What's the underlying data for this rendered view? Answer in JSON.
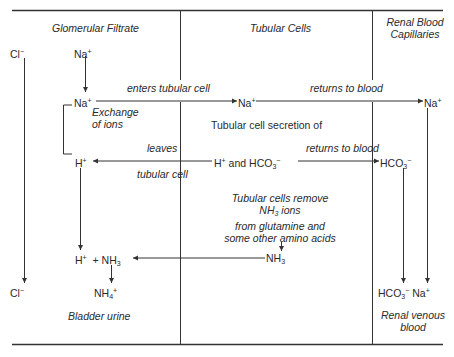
{
  "columns": {
    "glomerular": "Glomerular Filtrate",
    "tubular": "Tubular Cells",
    "capillaries_1": "Renal Blood",
    "capillaries_2": "Capillaries"
  },
  "ions": {
    "cl_top": "Cl",
    "cl_bottom": "Cl",
    "na_top": "Na",
    "na_exchange": "Na",
    "na_cell": "Na",
    "na_blood": "Na",
    "na_venous": "Na",
    "h_left": "H",
    "h_cell": "H",
    "hco3_cell": "HCO",
    "hco3_blood": "HCO",
    "hco3_venous": "HCO",
    "nh3_cell": "NH",
    "h_urine": "H",
    "nh3_urine": "NH",
    "nh4": "NH",
    "plus": "+",
    "minus": "−",
    "and": "and",
    "sub3": "3",
    "sub4": "4"
  },
  "labels": {
    "enters_tubular_cell": "enters tubular cell",
    "returns_to_blood_1": "returns to blood",
    "returns_to_blood_2": "returns to blood",
    "exchange_1": "Exchange",
    "exchange_2": "of ions",
    "secretion": "Tubular cell secretion of",
    "leaves": "leaves",
    "tubular_cell": "tubular cell",
    "remove_1": "Tubular cells remove",
    "remove_2": "NH",
    "remove_2b": "ions",
    "remove_3": "from glutamine and",
    "remove_4": "some other amino acids",
    "bladder_urine": "Bladder urine",
    "venous_1": "Renal venous",
    "venous_2": "blood"
  }
}
